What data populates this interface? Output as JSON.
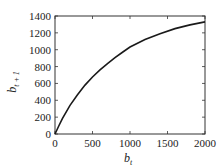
{
  "chart_data": {
    "type": "line",
    "title": "",
    "xlabel": "b_t",
    "ylabel": "b_{t+1}",
    "xlabel_main": "b",
    "xlabel_sub": "t",
    "ylabel_main": "b",
    "ylabel_sub": "t + 1",
    "xlim": [
      0,
      2000
    ],
    "ylim": [
      0,
      1400
    ],
    "xticks": [
      0,
      500,
      1000,
      1500,
      2000
    ],
    "yticks": [
      0,
      200,
      400,
      600,
      800,
      1000,
      1200,
      1400
    ],
    "xtick_labels": [
      "0",
      "500",
      "1000",
      "1500",
      "2000"
    ],
    "ytick_labels": [
      "0",
      "200",
      "400",
      "600",
      "800",
      "1000",
      "1200",
      "1400"
    ],
    "grid": false,
    "legend": null,
    "series": [
      {
        "name": "b_{t+1} vs b_t",
        "color": "#1a1a1a",
        "x": [
          0,
          50,
          100,
          200,
          300,
          400,
          500,
          600,
          700,
          800,
          900,
          1000,
          1200,
          1400,
          1600,
          1800,
          2000
        ],
        "y": [
          0,
          95,
          185,
          340,
          465,
          580,
          676,
          760,
          835,
          905,
          970,
          1032,
          1120,
          1190,
          1250,
          1295,
          1330
        ]
      }
    ]
  },
  "colors": {
    "line": "#1a1a1a",
    "axis": "#333333",
    "background": "#ffffff"
  }
}
